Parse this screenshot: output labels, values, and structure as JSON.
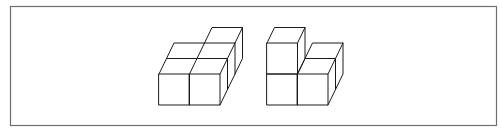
{
  "diagram": {
    "title": "",
    "colors": {
      "background": "#ffffff",
      "frame": "#6e6e6e",
      "edges": "#1a1a1a"
    },
    "frame": {
      "x": 10,
      "y": 6,
      "width": 486,
      "height": 119
    },
    "figures": [
      {
        "id": "figure-left",
        "label": "",
        "cube_count": 5,
        "description": "Single-layer arrangement: 2x2 block of cubes plus one extra cube behind the right column"
      },
      {
        "id": "figure-right",
        "label": "",
        "cube_count": 4,
        "description": "L-shaped arrangement: left column stacked 2 high, right column one cube high with one cube behind it"
      }
    ]
  }
}
